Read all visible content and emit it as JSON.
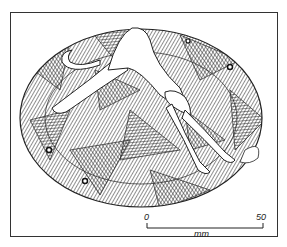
{
  "figure": {
    "colors": {
      "ink": "#222222",
      "paper": "#ffffff",
      "border": "#333333"
    },
    "holes": 4
  },
  "scale_bar": {
    "start_label": "0",
    "end_label": "50",
    "unit_label": "mm"
  }
}
